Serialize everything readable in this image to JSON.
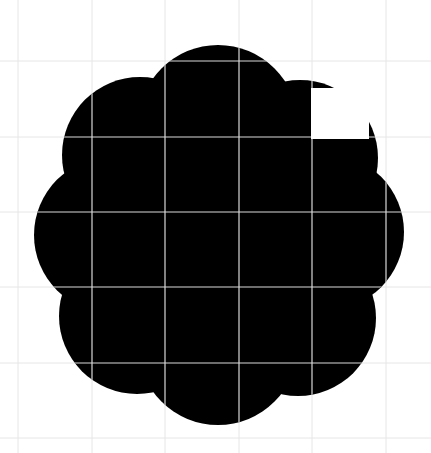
{
  "image": {
    "width": 431,
    "height": 453,
    "background": "#ffffff"
  },
  "shape": {
    "type": "scalloped-flower",
    "fill": "#000000",
    "center": [
      219,
      235
    ],
    "lobe_count": 8,
    "lobes": [
      {
        "cx": 218,
        "cy": 125,
        "r": 80
      },
      {
        "cx": 300,
        "cy": 158,
        "r": 78
      },
      {
        "cx": 326,
        "cy": 232,
        "r": 78
      },
      {
        "cx": 298,
        "cy": 318,
        "r": 78
      },
      {
        "cx": 218,
        "cy": 345,
        "r": 80
      },
      {
        "cx": 137,
        "cy": 316,
        "r": 78
      },
      {
        "cx": 112,
        "cy": 235,
        "r": 78
      },
      {
        "cx": 140,
        "cy": 155,
        "r": 78
      }
    ],
    "core": {
      "cx": 219,
      "cy": 235,
      "r": 130
    }
  },
  "grid": {
    "color": "#e6e6e6",
    "inner_color": "#d9d9d9",
    "x_lines": [
      18,
      92,
      165,
      239,
      312,
      386
    ],
    "y_lines": [
      61,
      137,
      212,
      287,
      363,
      438
    ]
  },
  "cutout": {
    "fill": "#ffffff",
    "x": 311,
    "y": 88,
    "width": 58,
    "height": 51
  }
}
